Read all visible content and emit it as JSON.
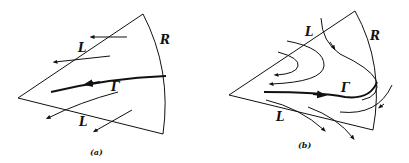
{
  "figure": {
    "panels": [
      {
        "id": "a",
        "caption": "(a)",
        "labels": {
          "L_top": "L",
          "L_bottom": "L",
          "R": "R",
          "Gamma": "Γ"
        },
        "description": "Wedge region bounded by two lines L and arc R; flow lines cross from R outward through L; curve Γ flows toward apex"
      },
      {
        "id": "b",
        "caption": "(b)",
        "labels": {
          "L_top": "L",
          "L_bottom": "L",
          "R": "R",
          "Gamma": "Γ"
        },
        "description": "Wedge region bounded by two lines L and arc R; flow lines turn back (hairpin) inside the wedge; curve Γ flows toward R"
      }
    ],
    "colors": {
      "ink": "#111111",
      "background": "#ffffff"
    }
  }
}
